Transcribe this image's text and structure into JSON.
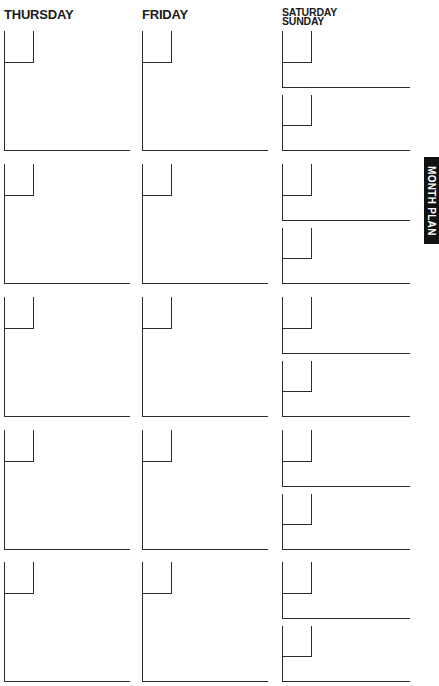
{
  "headers": {
    "thursday": "THURSDAY",
    "friday": "FRIDAY",
    "saturday": "SATURDAY",
    "sunday": "SUNDAY"
  },
  "side_tab": {
    "label": "MONTH PLAN"
  },
  "weeks": [
    {
      "thursday": "",
      "friday": "",
      "saturday": "",
      "sunday": ""
    },
    {
      "thursday": "",
      "friday": "",
      "saturday": "",
      "sunday": ""
    },
    {
      "thursday": "",
      "friday": "",
      "saturday": "",
      "sunday": ""
    },
    {
      "thursday": "",
      "friday": "",
      "saturday": "",
      "sunday": ""
    },
    {
      "thursday": "",
      "friday": "",
      "saturday": "",
      "sunday": ""
    }
  ]
}
